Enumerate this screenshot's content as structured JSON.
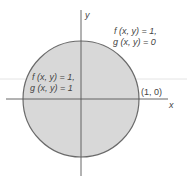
{
  "diagram": {
    "axes": {
      "x_label": "x",
      "y_label": "y"
    },
    "region": {
      "description": "unit disk",
      "fill_color": "#d6d6d6",
      "edge_color": "#666666"
    },
    "annotations": {
      "outside": {
        "line1": "f (x, y) = 1,",
        "line2": "g (x, y) = 0"
      },
      "inside": {
        "line1": "f (x, y) = 1,",
        "line2": "g (x, y) = 1"
      },
      "point": "(1, 0)"
    }
  }
}
